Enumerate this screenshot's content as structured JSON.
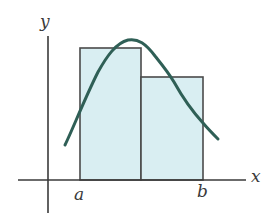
{
  "diagram": {
    "type": "riemann-sum-illustration",
    "axes": {
      "x_label": "x",
      "y_label": "y"
    },
    "interval": {
      "left_label": "a",
      "right_label": "b"
    },
    "rectangles": [
      {
        "name": "left-rectangle",
        "height_rank": "taller"
      },
      {
        "name": "right-rectangle",
        "height_rank": "shorter"
      }
    ],
    "curve": {
      "description": "bell-shaped function curve rising from left, peaking near middle of interval, falling to right"
    },
    "colors": {
      "rect_fill": "#d9eef2",
      "rect_stroke": "#4a4a4a",
      "curve": "#2f5f56",
      "axes": "#3a3a3a",
      "label": "#3a3a3a"
    }
  }
}
